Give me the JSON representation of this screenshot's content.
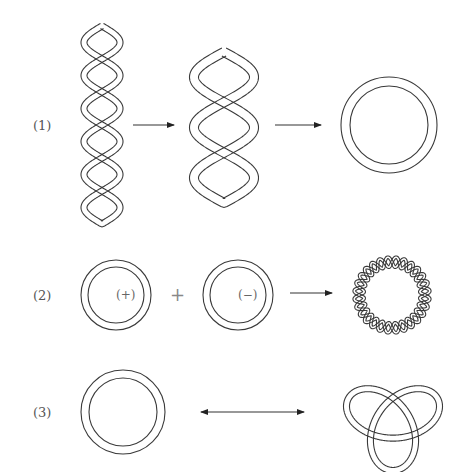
{
  "figure": {
    "rows": [
      {
        "label": "(1)",
        "description": "Twisted circular DNA: tightly twisted chain (6 loops) relaxes to figure-eight (3 loops) then to relaxed circle",
        "stages": [
          "twisted-chain-6-loops",
          "figure-eight-3-loops",
          "relaxed-circle"
        ],
        "connectors": [
          "arrow-right",
          "arrow-right"
        ]
      },
      {
        "label": "(2)",
        "description": "Positive and negative supercoiled circles combine into a wavy supercoiled ring",
        "stages": [
          "circle-positive",
          "circle-negative",
          "supercoiled-ring"
        ],
        "circle_signs": [
          "(+)",
          "(−)"
        ],
        "operator": "+",
        "connectors": [
          "arrow-right"
        ]
      },
      {
        "label": "(3)",
        "description": "Relaxed circle interconverts with trefoil knot",
        "stages": [
          "relaxed-circle",
          "trefoil-knot"
        ],
        "connectors": [
          "double-arrow"
        ]
      }
    ],
    "colors": {
      "line": "#3a3a3a",
      "text": "#555555",
      "background": "#ffffff"
    }
  }
}
